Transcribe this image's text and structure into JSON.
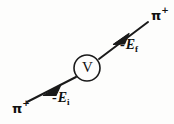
{
  "diagram": {
    "background_color": "#fdfdfc",
    "line_color": "#1a1a1a",
    "vertex": {
      "label": "V",
      "name": "interaction-vertex",
      "cx": 87,
      "cy": 68,
      "r": 13
    },
    "particles": {
      "incoming": {
        "symbol": "π",
        "charge": "+",
        "position": "top-right"
      },
      "outgoing": {
        "symbol": "π",
        "charge": "+",
        "position": "bottom-left"
      }
    },
    "energy_labels": {
      "final": {
        "minus": "-",
        "symbol": "E",
        "subscript": "f"
      },
      "initial": {
        "minus": "-",
        "symbol": "E",
        "subscript": "i"
      }
    },
    "lines": [
      {
        "name": "incoming-pion-line",
        "from": [
          148,
          22
        ],
        "to": [
          98,
          60
        ],
        "arrow_at": [
          120,
          39
        ],
        "direction": "down-left"
      },
      {
        "name": "outgoing-pion-line",
        "from": [
          77,
          77
        ],
        "to": [
          27,
          102
        ],
        "arrow_at": [
          52,
          90
        ],
        "direction": "down-left"
      }
    ]
  }
}
